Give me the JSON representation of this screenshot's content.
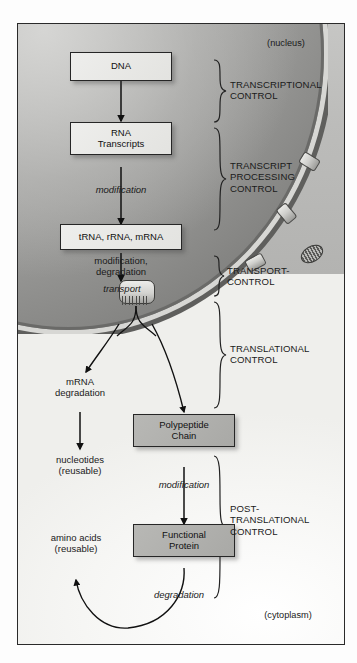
{
  "diagram": {
    "compartments": {
      "nucleus_label": "(nucleus)",
      "cytoplasm_label": "(cytoplasm)"
    },
    "nodes": [
      {
        "id": "dna",
        "label": "DNA",
        "style": "light"
      },
      {
        "id": "rna",
        "label": "RNA\nTranscripts",
        "style": "light"
      },
      {
        "id": "rnas",
        "label": "tRNA, rRNA, mRNA",
        "style": "light"
      },
      {
        "id": "polypeptide",
        "label": "Polypeptide\nChain",
        "style": "dark"
      },
      {
        "id": "protein",
        "label": "Functional\nProtein",
        "style": "dark"
      }
    ],
    "edge_labels": [
      {
        "id": "modification-1",
        "text": "modification",
        "italic": true
      },
      {
        "id": "modification-degradation",
        "text": "modification,\ndegradation",
        "italic": false
      },
      {
        "id": "transport",
        "text": "transport",
        "italic": true
      },
      {
        "id": "modification-2",
        "text": "modification",
        "italic": true
      },
      {
        "id": "degradation",
        "text": "degradation",
        "italic": true
      }
    ],
    "side_products": [
      {
        "id": "mrna-degradation",
        "text": "mRNA\ndegradation"
      },
      {
        "id": "nucleotides",
        "text": "nucleotides\n(reusable)"
      },
      {
        "id": "amino-acids",
        "text": "amino acids\n(reusable)"
      }
    ],
    "control_levels": [
      {
        "id": "transcriptional",
        "text": "TRANSCRIPTIONAL\nCONTROL"
      },
      {
        "id": "transcript-processing",
        "text": "TRANSCRIPT\nPROCESSING\nCONTROL"
      },
      {
        "id": "transport-control",
        "text": "TRANSPORT-\nCONTROL"
      },
      {
        "id": "translational",
        "text": "TRANSLATIONAL\nCONTROL"
      },
      {
        "id": "post-translational",
        "text": "POST-\nTRANSLATIONAL\nCONTROL"
      }
    ],
    "colors": {
      "frame_border": "#2a2a2a",
      "nucleus_fill": "#b5b5b3",
      "envelope_band": "#d7d7d4",
      "node_light": "#e8e8e5",
      "node_dark": "#b0b0ad",
      "text": "#1a1a1a"
    },
    "icons": {
      "nuclear_pore": "nuclear-pore-icon",
      "transport_pore": "transport-pore-icon"
    }
  }
}
